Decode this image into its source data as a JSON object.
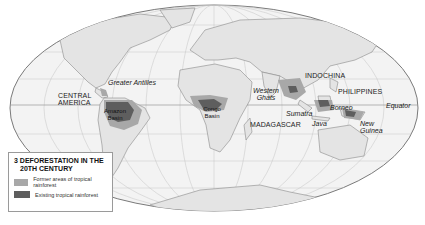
{
  "map": {
    "projection": "Mollweide",
    "colors": {
      "ocean": "#f3f3f3",
      "land": "#e4e4e4",
      "coast": "#8a8a8a",
      "grid": "#bdbdbd",
      "former_rainforest": "#a8a8a8",
      "existing_rainforest": "#5e5e5e"
    },
    "labels": {
      "central_america": "CENTRAL\nAMERICA",
      "greater_antilles": "Greater Antilles",
      "amazon_basin": "Amazon Basin",
      "congo_basin": "Congo Basin",
      "western_ghats": "Western Ghats",
      "madagascar": "MADAGASCAR",
      "indochina": "INDOCHINA",
      "philippines": "PHILIPPINES",
      "sumatra": "Sumatra",
      "borneo": "Borneo",
      "java": "Java",
      "new_guinea": "New Guinea",
      "equator": "Equator"
    }
  },
  "legend": {
    "number": "3",
    "title_line1": "Deforestation in the",
    "title_line2": "20th century",
    "items": [
      {
        "label": "Former areas of tropical rainforest",
        "color": "#a8a8a8"
      },
      {
        "label": "Existing tropical rainforest",
        "color": "#5e5e5e"
      }
    ]
  }
}
